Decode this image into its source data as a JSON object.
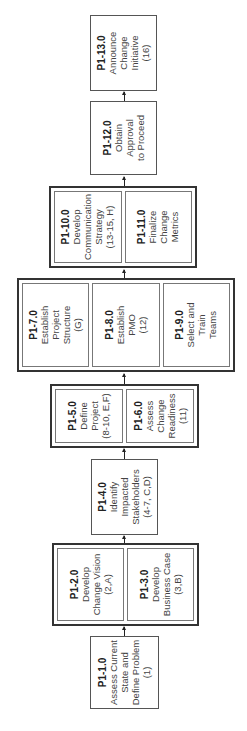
{
  "diagram": {
    "orientation": "rotated-90-ccw",
    "steps": [
      {
        "id": "P1-1.0",
        "lines": [
          "Assess Current",
          "State and",
          "Define Problem",
          "(1)"
        ]
      },
      {
        "id": "P1-2.0",
        "lines": [
          "Develop",
          "Change Vision",
          "(2,A)"
        ]
      },
      {
        "id": "P1-3.0",
        "lines": [
          "Develop",
          "Business Case",
          "(3,B)"
        ]
      },
      {
        "id": "P1-4.0",
        "lines": [
          "Identify",
          "Impacted",
          "Stakeholders",
          "(4-7, C,D)"
        ]
      },
      {
        "id": "P1-5.0",
        "lines": [
          "Define Project",
          "(8-10, E,F)"
        ]
      },
      {
        "id": "P1-6.0",
        "lines": [
          "Assess Change",
          "Readiness",
          "(11)"
        ]
      },
      {
        "id": "P1-7.0",
        "lines": [
          "Establish",
          "Project",
          "Structure",
          "(G)"
        ]
      },
      {
        "id": "P1-8.0",
        "lines": [
          "Establish",
          "PMO",
          "(12)"
        ]
      },
      {
        "id": "P1-9.0",
        "lines": [
          "Select and",
          "Train",
          "Teams"
        ]
      },
      {
        "id": "P1-10.0",
        "lines": [
          "Develop",
          "Communication",
          "Strategy",
          "(13-15, H)"
        ]
      },
      {
        "id": "P1-11.0",
        "lines": [
          "Finalize",
          "Change",
          "Metrics"
        ]
      },
      {
        "id": "P1-12.0",
        "lines": [
          "Obtain",
          "Approval",
          "to Proceed"
        ]
      },
      {
        "id": "P1-13.0",
        "lines": [
          "Announce",
          "Change",
          "Initiative",
          "(16)"
        ]
      }
    ],
    "groups": [
      {
        "name": "group-2-3",
        "members": [
          "P1-2.0",
          "P1-3.0"
        ]
      },
      {
        "name": "group-5-6",
        "members": [
          "P1-5.0",
          "P1-6.0"
        ]
      },
      {
        "name": "group-7-8-9",
        "members": [
          "P1-7.0",
          "P1-8.0",
          "P1-9.0"
        ]
      },
      {
        "name": "group-10-11",
        "members": [
          "P1-10.0",
          "P1-11.0"
        ]
      }
    ],
    "flow": [
      "P1-1.0",
      "group-2-3",
      "P1-4.0",
      "group-5-6",
      "group-7-8-9",
      "group-10-11",
      "P1-12.0",
      "P1-13.0"
    ]
  }
}
